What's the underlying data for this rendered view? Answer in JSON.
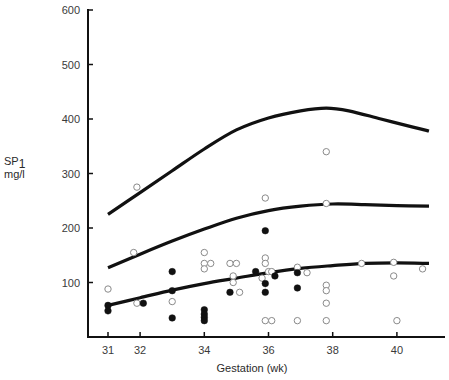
{
  "chart_data": {
    "type": "scatter",
    "title": "",
    "xlabel": "Gestation (wk)",
    "ylabel": "SP1 mg/l",
    "ylabel_main": "SP",
    "ylabel_sub": "1",
    "ylabel_unit": "mg/l",
    "xlim": [
      30.5,
      41.2
    ],
    "ylim": [
      0,
      600
    ],
    "x_ticks": [
      31,
      32,
      34,
      36,
      38,
      40
    ],
    "y_ticks": [
      100,
      200,
      300,
      400,
      500,
      600
    ],
    "grid": false,
    "legend": null,
    "series": [
      {
        "name": "Upper centile curve",
        "style": "line",
        "points": [
          [
            31,
            225
          ],
          [
            32,
            265
          ],
          [
            33,
            305
          ],
          [
            34,
            345
          ],
          [
            35,
            380
          ],
          [
            36,
            402
          ],
          [
            37,
            415
          ],
          [
            37.8,
            420
          ],
          [
            38.5,
            415
          ],
          [
            39.5,
            400
          ],
          [
            40.5,
            385
          ],
          [
            41,
            378
          ]
        ]
      },
      {
        "name": "Median curve",
        "style": "line",
        "points": [
          [
            31,
            127
          ],
          [
            32,
            152
          ],
          [
            33,
            176
          ],
          [
            34,
            198
          ],
          [
            35,
            218
          ],
          [
            36,
            232
          ],
          [
            37,
            240
          ],
          [
            38,
            244
          ],
          [
            39,
            243
          ],
          [
            40,
            241
          ],
          [
            41,
            240
          ]
        ]
      },
      {
        "name": "Lower centile curve",
        "style": "line",
        "points": [
          [
            31,
            58
          ],
          [
            32,
            72
          ],
          [
            33,
            86
          ],
          [
            34,
            98
          ],
          [
            35,
            108
          ],
          [
            36,
            118
          ],
          [
            37,
            126
          ],
          [
            38,
            131
          ],
          [
            39,
            135
          ],
          [
            40,
            136
          ],
          [
            41,
            135
          ]
        ]
      },
      {
        "name": "Open circles",
        "style": "open-marker",
        "points": [
          [
            31,
            88
          ],
          [
            31.9,
            275
          ],
          [
            31.8,
            155
          ],
          [
            31.9,
            62
          ],
          [
            33,
            65
          ],
          [
            34,
            155
          ],
          [
            34,
            135
          ],
          [
            34.2,
            135
          ],
          [
            34,
            125
          ],
          [
            34.8,
            135
          ],
          [
            35,
            135
          ],
          [
            34.9,
            112
          ],
          [
            34.9,
            100
          ],
          [
            35.1,
            82
          ],
          [
            35.9,
            255
          ],
          [
            35.9,
            145
          ],
          [
            35.9,
            135
          ],
          [
            36,
            120
          ],
          [
            36.1,
            120
          ],
          [
            35.8,
            108
          ],
          [
            35.9,
            30
          ],
          [
            36.1,
            30
          ],
          [
            36.9,
            128
          ],
          [
            37.2,
            118
          ],
          [
            36.9,
            30
          ],
          [
            37.8,
            340
          ],
          [
            37.8,
            245
          ],
          [
            37.8,
            95
          ],
          [
            37.8,
            85
          ],
          [
            37.8,
            62
          ],
          [
            37.8,
            30
          ],
          [
            38.9,
            135
          ],
          [
            39.9,
            137
          ],
          [
            39.9,
            112
          ],
          [
            40,
            30
          ],
          [
            40.8,
            125
          ]
        ]
      },
      {
        "name": "Filled circles",
        "style": "filled-marker",
        "points": [
          [
            31,
            58
          ],
          [
            31,
            48
          ],
          [
            32.1,
            62
          ],
          [
            33,
            120
          ],
          [
            33,
            85
          ],
          [
            33,
            35
          ],
          [
            34,
            50
          ],
          [
            34,
            42
          ],
          [
            34,
            36
          ],
          [
            34,
            30
          ],
          [
            34.8,
            82
          ],
          [
            35.9,
            195
          ],
          [
            35.6,
            120
          ],
          [
            36.2,
            112
          ],
          [
            35.9,
            98
          ],
          [
            35.9,
            82
          ],
          [
            36.9,
            118
          ],
          [
            36.9,
            90
          ]
        ]
      }
    ]
  }
}
